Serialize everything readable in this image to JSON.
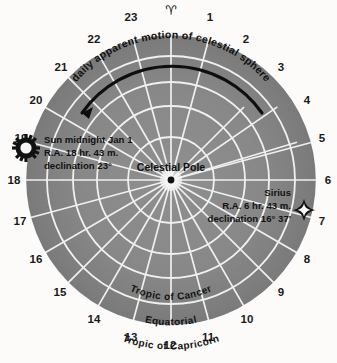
{
  "diagram": {
    "center_label": "Celestial Pole",
    "vernal_equinox_symbol": "♈",
    "motion_label": "daily apparent motion of celestial sphere",
    "colors": {
      "background": "#fcfbfa",
      "disc_fill": "#8d8d8d",
      "disc_fill_outer": "#7e7e7e",
      "grid": "#f2f2f2",
      "ink": "#111111"
    },
    "hour_numbers": [
      "1",
      "2",
      "3",
      "4",
      "5",
      "6",
      "7",
      "8",
      "9",
      "10",
      "11",
      "12",
      "13",
      "14",
      "15",
      "16",
      "17",
      "18",
      "19",
      "20",
      "21",
      "22",
      "23"
    ],
    "ring_labels": [
      {
        "name": "tropic-of-cancer",
        "text": "Tropic of Cancer"
      },
      {
        "name": "equatorial",
        "text": "Equatorial"
      },
      {
        "name": "tropic-of-capricorn",
        "text": "Tropic of Capricorn"
      }
    ],
    "sun_marker": {
      "icon": "sun-icon",
      "line1": "Sun midnight Jan 1",
      "line2": "R.A. 18 hr. 43 m.",
      "line3": "declination 23°"
    },
    "sirius_marker": {
      "icon": "star-icon",
      "line1": "Sirius",
      "line2": "R.A. 6 hr. 43 m.",
      "line3": "declination 16° 37'"
    }
  }
}
